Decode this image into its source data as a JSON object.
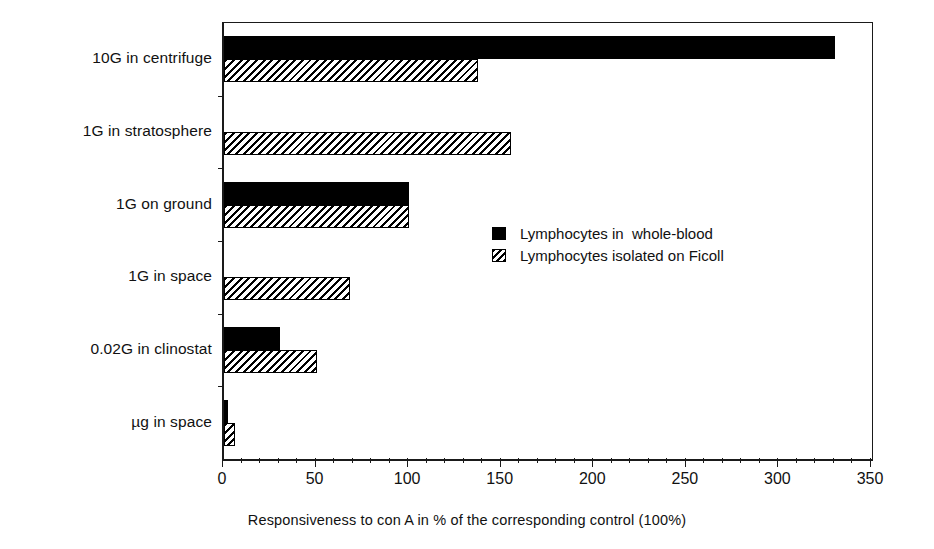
{
  "chart_data": {
    "type": "bar",
    "orientation": "horizontal",
    "title": "",
    "xlabel": "Responsiveness to con A in % of the corresponding control (100%)",
    "ylabel": "",
    "xlim": [
      0,
      350
    ],
    "xticks": [
      0,
      50,
      100,
      150,
      200,
      250,
      300,
      350
    ],
    "xtick_labels": [
      "0",
      "50",
      "100",
      "150",
      "200",
      "250",
      "300",
      "350"
    ],
    "minor_tick_step": 10,
    "grid": false,
    "legend_position": "center-right",
    "categories": [
      "10G in centrifuge",
      "1G  in stratosphere",
      "1G on ground",
      "1G in space",
      "0.02G in clinostat",
      "µg in space"
    ],
    "series": [
      {
        "name": "Lymphocytes in  whole-blood",
        "pattern": "solid",
        "color": "#000000",
        "values": [
          330,
          0,
          100,
          0,
          30,
          2
        ]
      },
      {
        "name": "Lymphocytes isolated on Ficoll",
        "pattern": "hatched",
        "color": "#000000",
        "values": [
          137,
          155,
          100,
          68,
          50,
          6
        ]
      }
    ]
  },
  "legend": {
    "items": [
      {
        "label": "Lymphocytes in  whole-blood",
        "swatch": "solid"
      },
      {
        "label": "Lymphocytes isolated on Ficoll",
        "swatch": "hatched"
      }
    ]
  },
  "axis": {
    "x_title": "Responsiveness to con A in % of the corresponding control (100%)"
  }
}
